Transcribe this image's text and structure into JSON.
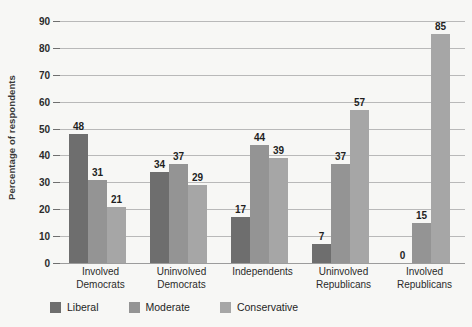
{
  "chart_data": {
    "type": "bar",
    "title": "",
    "subtitle": "",
    "xlabel": "",
    "ylabel": "Percentage of respondents",
    "ylim": [
      0,
      90
    ],
    "ytick_step": 10,
    "yticks": [
      0,
      10,
      20,
      30,
      40,
      50,
      60,
      70,
      80,
      90
    ],
    "grid": "horizontal",
    "legend_position": "bottom-left",
    "categories": [
      "Involved Democrats",
      "Uninvolved Democrats",
      "Independents",
      "Uninvolved Republicans",
      "Involved Republicans"
    ],
    "category_lines": [
      [
        "Involved",
        "Democrats"
      ],
      [
        "Uninvolved",
        "Democrats"
      ],
      [
        "Independents",
        ""
      ],
      [
        "Uninvolved",
        "Republicans"
      ],
      [
        "Involved",
        "Republicans"
      ]
    ],
    "series": [
      {
        "name": "Liberal",
        "color": "#6e6e6e",
        "values": [
          48,
          34,
          17,
          7,
          0
        ]
      },
      {
        "name": "Moderate",
        "color": "#949494",
        "values": [
          31,
          37,
          44,
          37,
          15
        ]
      },
      {
        "name": "Conservative",
        "color": "#a6a6a6",
        "values": [
          21,
          29,
          39,
          57,
          85
        ]
      }
    ],
    "data_labels": [
      [
        48,
        31,
        21
      ],
      [
        34,
        37,
        29
      ],
      [
        17,
        44,
        39
      ],
      [
        7,
        37,
        57
      ],
      [
        0,
        15,
        85
      ]
    ]
  },
  "colors": {
    "background": "#f7f7f5",
    "gridline": "#b9b9b9",
    "baseline": "#9c9c9c",
    "text": "#1f1f1f",
    "liberal": "#6e6e6e",
    "moderate": "#949494",
    "conservative": "#a6a6a6"
  }
}
